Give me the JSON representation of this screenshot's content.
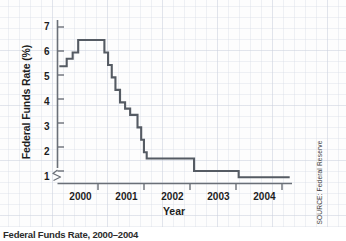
{
  "figure": {
    "caption": "Federal Funds Rate, 2000–2004",
    "source_note": "SOURCE: Federal Reserve"
  },
  "chart_data": {
    "type": "line",
    "style": "step",
    "title": "",
    "xlabel": "Year",
    "ylabel": "Federal Funds Rate (%)",
    "xlim": [
      1999.5,
      2004.6
    ],
    "ylim": [
      0.75,
      7.3
    ],
    "y_axis_break": true,
    "y_axis_break_symbol": "≶",
    "grid": true,
    "grid_style": "graph-paper",
    "legend": "none",
    "line_color": "#555b63",
    "xticks": [
      "2000",
      "2001",
      "2002",
      "2003",
      "2004"
    ],
    "xtick_values": [
      2000,
      2001,
      2002,
      2003,
      2004
    ],
    "yticks": [
      "1",
      "2",
      "3",
      "4",
      "5",
      "6",
      "7"
    ],
    "ytick_values": [
      1,
      2,
      3,
      4,
      5,
      6,
      7
    ],
    "series": [
      {
        "name": "Federal Funds Rate",
        "points": [
          {
            "x": 1999.54,
            "y": 5.45
          },
          {
            "x": 1999.7,
            "y": 5.45
          },
          {
            "x": 1999.7,
            "y": 5.75
          },
          {
            "x": 1999.83,
            "y": 5.75
          },
          {
            "x": 1999.83,
            "y": 6.0
          },
          {
            "x": 1999.95,
            "y": 6.0
          },
          {
            "x": 1999.95,
            "y": 6.5
          },
          {
            "x": 2000.52,
            "y": 6.5
          },
          {
            "x": 2000.52,
            "y": 6.0
          },
          {
            "x": 2000.6,
            "y": 6.0
          },
          {
            "x": 2000.6,
            "y": 5.5
          },
          {
            "x": 2000.68,
            "y": 5.5
          },
          {
            "x": 2000.68,
            "y": 5.0
          },
          {
            "x": 2000.76,
            "y": 5.0
          },
          {
            "x": 2000.76,
            "y": 4.5
          },
          {
            "x": 2000.86,
            "y": 4.5
          },
          {
            "x": 2000.86,
            "y": 4.0
          },
          {
            "x": 2000.97,
            "y": 4.0
          },
          {
            "x": 2000.97,
            "y": 3.75
          },
          {
            "x": 2001.08,
            "y": 3.75
          },
          {
            "x": 2001.08,
            "y": 3.5
          },
          {
            "x": 2001.24,
            "y": 3.5
          },
          {
            "x": 2001.24,
            "y": 3.0
          },
          {
            "x": 2001.32,
            "y": 3.0
          },
          {
            "x": 2001.32,
            "y": 2.5
          },
          {
            "x": 2001.38,
            "y": 2.5
          },
          {
            "x": 2001.38,
            "y": 2.0
          },
          {
            "x": 2001.44,
            "y": 2.0
          },
          {
            "x": 2001.44,
            "y": 1.75
          },
          {
            "x": 2002.47,
            "y": 1.75
          },
          {
            "x": 2002.47,
            "y": 1.25
          },
          {
            "x": 2003.44,
            "y": 1.25
          },
          {
            "x": 2003.44,
            "y": 1.0
          },
          {
            "x": 2004.55,
            "y": 1.0
          }
        ]
      }
    ]
  }
}
